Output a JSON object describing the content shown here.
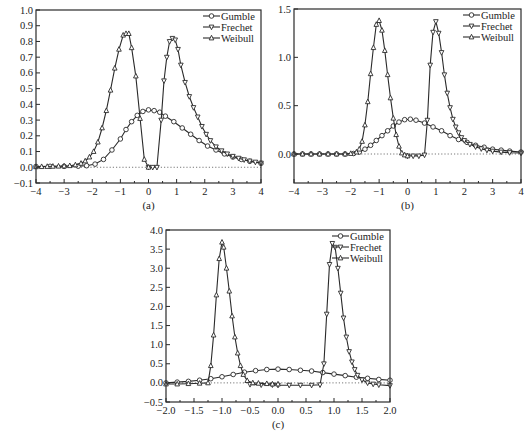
{
  "colors": {
    "line": "#2a2a2a",
    "frame": "#2a2a2a",
    "zero_line": "#555555",
    "background": "#ffffff"
  },
  "chart_data": [
    {
      "id": "a",
      "type": "line",
      "caption": "(a)",
      "title": "",
      "xlabel": "",
      "ylabel": "",
      "xlim": [
        -4,
        4
      ],
      "ylim": [
        -0.1,
        1.0
      ],
      "xticks": [
        -4,
        -3,
        -2,
        -1,
        0,
        1,
        2,
        3,
        4
      ],
      "xtick_labels": [
        "−4",
        "−3",
        "−2",
        "−1",
        "0",
        "1",
        "2",
        "3",
        "4"
      ],
      "yticks": [
        -0.1,
        0.0,
        0.1,
        0.2,
        0.3,
        0.4,
        0.5,
        0.6,
        0.7,
        0.8,
        0.9,
        1.0
      ],
      "ytick_labels": [
        "−0.1",
        "0.0",
        "0.1",
        "0.2",
        "0.3",
        "0.4",
        "0.5",
        "0.6",
        "0.7",
        "0.8",
        "0.9",
        "1.0"
      ],
      "grid": false,
      "zero_line": true,
      "legend": {
        "position": "upper right",
        "entries": [
          "Gumble",
          "Frechet",
          "Weibull"
        ]
      },
      "frame": {
        "x": 36,
        "y": 10,
        "w": 225,
        "h": 173
      },
      "series": [
        {
          "name": "Gumble",
          "marker": "circle",
          "x": [
            -4,
            -3.5,
            -3,
            -2.5,
            -2.2,
            -1.9,
            -1.6,
            -1.3,
            -1.0,
            -0.8,
            -0.6,
            -0.4,
            -0.2,
            0,
            0.2,
            0.4,
            0.6,
            0.9,
            1.2,
            1.5,
            1.8,
            2.1,
            2.4,
            2.7,
            3.0,
            3.3,
            3.6,
            4.0
          ],
          "y": [
            0.005,
            0.006,
            0.006,
            0.007,
            0.01,
            0.02,
            0.05,
            0.11,
            0.18,
            0.24,
            0.29,
            0.33,
            0.355,
            0.365,
            0.36,
            0.35,
            0.325,
            0.29,
            0.25,
            0.21,
            0.17,
            0.135,
            0.11,
            0.085,
            0.065,
            0.05,
            0.038,
            0.025
          ]
        },
        {
          "name": "Frechet",
          "marker": "triangle-down",
          "x": [
            0.0,
            0.15,
            0.3,
            0.45,
            0.55,
            0.65,
            0.75,
            0.85,
            0.95,
            1.05,
            1.15,
            1.3,
            1.45,
            1.6,
            1.75,
            1.9,
            2.05,
            2.2,
            2.4,
            2.6,
            2.8,
            3.0,
            3.2,
            3.4,
            3.6,
            3.8,
            4.0
          ],
          "y": [
            0.0,
            0.0,
            0.0,
            0.3,
            0.55,
            0.7,
            0.8,
            0.82,
            0.81,
            0.75,
            0.65,
            0.54,
            0.45,
            0.38,
            0.32,
            0.26,
            0.21,
            0.17,
            0.13,
            0.105,
            0.085,
            0.07,
            0.058,
            0.048,
            0.04,
            0.033,
            0.027
          ]
        },
        {
          "name": "Weibull",
          "marker": "triangle-up",
          "x": [
            -4.0,
            -3.8,
            -3.6,
            -3.4,
            -3.2,
            -3.0,
            -2.8,
            -2.6,
            -2.4,
            -2.25,
            -2.1,
            -1.95,
            -1.8,
            -1.65,
            -1.5,
            -1.35,
            -1.2,
            -1.05,
            -0.9,
            -0.8,
            -0.7,
            -0.6,
            -0.45,
            -0.3,
            -0.15,
            0.0
          ],
          "y": [
            0.003,
            0.004,
            0.005,
            0.006,
            0.007,
            0.008,
            0.01,
            0.015,
            0.025,
            0.04,
            0.065,
            0.1,
            0.16,
            0.25,
            0.36,
            0.49,
            0.63,
            0.75,
            0.84,
            0.85,
            0.85,
            0.76,
            0.58,
            0.31,
            0.05,
            0.0
          ]
        }
      ]
    },
    {
      "id": "b",
      "type": "line",
      "caption": "(b)",
      "title": "",
      "xlabel": "",
      "ylabel": "",
      "xlim": [
        -4,
        4
      ],
      "ylim": [
        -0.3,
        1.5
      ],
      "xticks": [
        -4,
        -3,
        -2,
        -1,
        0,
        1,
        2,
        3,
        4
      ],
      "xtick_labels": [
        "−4",
        "−3",
        "−2",
        "−1",
        "0",
        "1",
        "2",
        "3",
        "4"
      ],
      "yticks": [
        0.0,
        0.5,
        1.0,
        1.5
      ],
      "ytick_labels": [
        "0.0",
        "0.5",
        "1.0",
        "1.5"
      ],
      "grid": false,
      "zero_line": true,
      "legend": {
        "position": "upper right",
        "entries": [
          "Gumble",
          "Frechet",
          "Weibull"
        ]
      },
      "frame": {
        "x": 294,
        "y": 9,
        "w": 227,
        "h": 174
      },
      "series": [
        {
          "name": "Gumble",
          "marker": "circle",
          "x": [
            -4,
            -3.7,
            -3.4,
            -3.1,
            -2.8,
            -2.5,
            -2.2,
            -1.9,
            -1.7,
            -1.5,
            -1.3,
            -1.1,
            -0.9,
            -0.7,
            -0.5,
            -0.3,
            -0.1,
            0.1,
            0.3,
            0.6,
            0.9,
            1.2,
            1.5,
            1.8,
            2.1,
            2.4,
            2.7,
            3.0,
            3.3,
            3.6,
            4.0
          ],
          "y": [
            0.0,
            0.0,
            0.0,
            0.0,
            0.0,
            0.0,
            0.0,
            0.005,
            0.02,
            0.05,
            0.09,
            0.14,
            0.19,
            0.24,
            0.29,
            0.33,
            0.355,
            0.36,
            0.35,
            0.32,
            0.28,
            0.24,
            0.19,
            0.15,
            0.12,
            0.09,
            0.07,
            0.05,
            0.04,
            0.03,
            0.02
          ]
        },
        {
          "name": "Frechet",
          "marker": "triangle-down",
          "x": [
            0.0,
            0.2,
            0.4,
            0.6,
            0.7,
            0.8,
            0.9,
            1.0,
            1.1,
            1.2,
            1.3,
            1.4,
            1.5,
            1.6,
            1.7,
            1.8,
            1.9,
            2.0,
            2.2,
            2.4,
            2.6,
            2.8,
            3.0,
            3.3,
            3.6,
            4.0
          ],
          "y": [
            -0.02,
            -0.02,
            -0.02,
            -0.01,
            0.35,
            0.92,
            1.26,
            1.37,
            1.25,
            1.05,
            0.82,
            0.63,
            0.48,
            0.36,
            0.28,
            0.22,
            0.17,
            0.14,
            0.1,
            0.075,
            0.055,
            0.04,
            0.03,
            0.02,
            0.015,
            0.01
          ]
        },
        {
          "name": "Weibull",
          "marker": "triangle-up",
          "x": [
            -4.0,
            -3.7,
            -3.4,
            -3.1,
            -2.8,
            -2.5,
            -2.2,
            -2.0,
            -1.8,
            -1.7,
            -1.6,
            -1.5,
            -1.4,
            -1.3,
            -1.2,
            -1.1,
            -1.0,
            -0.9,
            -0.8,
            -0.7,
            -0.6,
            -0.5,
            -0.4,
            -0.3,
            -0.2,
            -0.1,
            0.0
          ],
          "y": [
            0.0,
            0.0,
            0.0,
            0.0,
            0.0,
            0.0,
            0.0,
            0.005,
            0.02,
            0.05,
            0.13,
            0.3,
            0.54,
            0.83,
            1.1,
            1.34,
            1.38,
            1.28,
            1.07,
            0.82,
            0.58,
            0.37,
            0.2,
            0.08,
            0.01,
            -0.01,
            -0.02
          ]
        }
      ]
    },
    {
      "id": "c",
      "type": "line",
      "caption": "(c)",
      "title": "",
      "xlabel": "",
      "ylabel": "",
      "xlim": [
        -2.0,
        2.0
      ],
      "ylim": [
        -0.5,
        4.0
      ],
      "xticks": [
        -2.0,
        -1.5,
        -1.0,
        -0.5,
        0.0,
        0.5,
        1.0,
        1.5,
        2.0
      ],
      "xtick_labels": [
        "−2.0",
        "−1.5",
        "−1.0",
        "−0.5",
        "0.0",
        "0.5",
        "1.0",
        "1.5",
        "2.0"
      ],
      "yticks": [
        -0.5,
        0.0,
        0.5,
        1.0,
        1.5,
        2.0,
        2.5,
        3.0,
        3.5,
        4.0
      ],
      "ytick_labels": [
        "−0.5",
        "0.0",
        "0.5",
        "1.0",
        "1.5",
        "2.0",
        "2.5",
        "3.0",
        "3.5",
        "4.0"
      ],
      "grid": false,
      "zero_line": true,
      "legend": {
        "position": "upper right",
        "entries": [
          "Gumble",
          "Frechet",
          "Weibull"
        ]
      },
      "frame": {
        "x": 166,
        "y": 230,
        "w": 224,
        "h": 172
      },
      "series": [
        {
          "name": "Gumble",
          "marker": "circle",
          "x": [
            -2.0,
            -1.8,
            -1.6,
            -1.4,
            -1.2,
            -1.0,
            -0.8,
            -0.6,
            -0.4,
            -0.2,
            0.0,
            0.2,
            0.4,
            0.6,
            0.8,
            1.0,
            1.2,
            1.4,
            1.6,
            1.8,
            2.0
          ],
          "y": [
            0.0,
            0.02,
            0.04,
            0.07,
            0.11,
            0.16,
            0.22,
            0.28,
            0.32,
            0.35,
            0.36,
            0.35,
            0.33,
            0.31,
            0.27,
            0.23,
            0.19,
            0.15,
            0.12,
            0.09,
            0.07
          ]
        },
        {
          "name": "Frechet",
          "marker": "triangle-down",
          "x": [
            -0.5,
            -0.3,
            -0.1,
            0.0,
            0.2,
            0.4,
            0.6,
            0.75,
            0.82,
            0.87,
            0.92,
            0.97,
            1.02,
            1.07,
            1.12,
            1.17,
            1.22,
            1.27,
            1.32,
            1.37,
            1.42,
            1.5,
            1.6,
            1.7,
            1.8,
            2.0
          ],
          "y": [
            -0.04,
            -0.05,
            -0.05,
            -0.06,
            -0.06,
            -0.06,
            -0.06,
            -0.05,
            0.5,
            1.8,
            3.1,
            3.65,
            3.55,
            3.0,
            2.35,
            1.7,
            1.2,
            0.82,
            0.55,
            0.35,
            0.2,
            0.08,
            0.0,
            -0.03,
            -0.05,
            -0.07
          ]
        },
        {
          "name": "Weibull",
          "marker": "triangle-up",
          "x": [
            -2.0,
            -1.8,
            -1.6,
            -1.4,
            -1.25,
            -1.2,
            -1.15,
            -1.1,
            -1.05,
            -1.0,
            -0.97,
            -0.92,
            -0.87,
            -0.82,
            -0.77,
            -0.72,
            -0.67,
            -0.62,
            -0.55,
            -0.45,
            -0.35,
            -0.2,
            -0.1,
            0.0
          ],
          "y": [
            -0.03,
            -0.03,
            -0.02,
            -0.01,
            0.0,
            0.45,
            1.25,
            2.3,
            3.25,
            3.68,
            3.55,
            3.0,
            2.4,
            1.75,
            1.2,
            0.78,
            0.45,
            0.22,
            0.06,
            0.0,
            -0.01,
            -0.02,
            -0.03,
            -0.03
          ]
        }
      ]
    }
  ]
}
